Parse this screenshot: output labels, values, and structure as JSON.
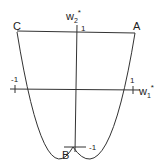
{
  "diagram": {
    "points": {
      "A": "A",
      "B": "B",
      "C": "C"
    },
    "axes": {
      "x_label": "w",
      "x_sub": "1",
      "x_sup": "*",
      "y_label": "w",
      "y_sub": "2",
      "y_sup": "*"
    },
    "ticks": {
      "x_neg": "-1",
      "x_pos": "1",
      "y_pos": "1",
      "y_neg": "-1"
    },
    "colors": {
      "stroke": "#333333"
    }
  }
}
